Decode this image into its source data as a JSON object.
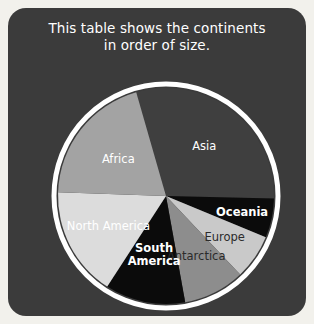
{
  "card": {
    "background_color": "#3b3b3b",
    "page_background_color": "#f2f1ec",
    "ring_color": "#ffffff"
  },
  "title": {
    "line1": "This table shows the continents",
    "line2": "in order of size."
  },
  "chart_data": {
    "type": "pie",
    "title": "This table shows the continents in order of size.",
    "xlabel": "",
    "ylabel": "",
    "legend_position": "none",
    "grid": false,
    "labels_inside_slices": true,
    "start_angle_deg": -16,
    "direction": "clockwise",
    "categories": [
      "Asia",
      "Oceania",
      "Europe",
      "Antarctica",
      "South America",
      "North America",
      "Africa"
    ],
    "values": [
      29.8,
      5.9,
      6.7,
      9.2,
      12.0,
      16.4,
      20.0
    ],
    "units": "percent of total land area",
    "slices": [
      {
        "label": "Asia",
        "value": 29.8,
        "color": "#3f3f3f",
        "label_color": "#ffffff",
        "bold": false
      },
      {
        "label": "Oceania",
        "value": 5.9,
        "color": "#0b0b0b",
        "label_color": "#ffffff",
        "bold": true
      },
      {
        "label": "Europe",
        "value": 6.7,
        "color": "#c9c9c9",
        "label_color": "#2b2b2b",
        "bold": false
      },
      {
        "label": "Antarctica",
        "value": 9.2,
        "color": "#8d8d8d",
        "label_color": "#2b2b2b",
        "bold": false
      },
      {
        "label": "South America",
        "value": 12.0,
        "color": "#0b0b0b",
        "label_color": "#ffffff",
        "bold": true
      },
      {
        "label": "North America",
        "value": 16.4,
        "color": "#dcdcdc",
        "label_color": "#ffffff",
        "bold": false
      },
      {
        "label": "Africa",
        "value": 20.0,
        "color": "#a3a3a3",
        "label_color": "#ffffff",
        "bold": false
      }
    ]
  }
}
